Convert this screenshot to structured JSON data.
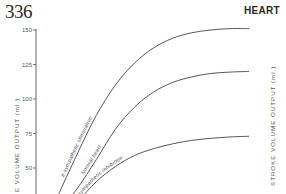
{
  "page": {
    "page_number": "336",
    "running_head": "HEART"
  },
  "chart_data": {
    "type": "line",
    "title": "",
    "xlabel": "",
    "ylabel": "STROKE VOLUME OUTPUT (ml.)",
    "ylabel_left_visible": "E VOLUME OUTPUT (ml.)",
    "ylabel_right": "STROKE VOLUME OUTPUT (ml.)",
    "ylim": [
      30,
      155
    ],
    "yticks": [
      50,
      75,
      100,
      125,
      150
    ],
    "ytick_labels": [
      "50",
      "75",
      "100",
      "125",
      "150"
    ],
    "x": [
      0,
      0.1,
      0.2,
      0.3,
      0.4,
      0.5,
      0.6,
      0.7,
      0.8,
      0.9,
      1.0
    ],
    "xlim": [
      0,
      1
    ],
    "grid": false,
    "series": [
      {
        "name": "sympathetic stimulation",
        "label": "sympathetic stimulation",
        "label_prefix": "e",
        "values": [
          30,
          60,
          88,
          110,
          126,
          137,
          144,
          148,
          150,
          151,
          151
        ]
      },
      {
        "name": "Normal heart",
        "label": "Normal heart",
        "values": [
          18,
          35,
          56,
          78,
          94,
          105,
          112,
          116,
          118.5,
          119.5,
          120
        ]
      },
      {
        "name": "sympathetic inhibition",
        "label": "sympathetic inhibition",
        "values": [
          10,
          25,
          40,
          51,
          59,
          64,
          67.5,
          70,
          71.5,
          72.5,
          73
        ]
      }
    ]
  }
}
